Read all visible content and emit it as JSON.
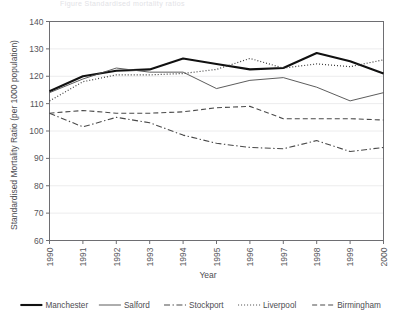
{
  "caption": {
    "text": "Figure   Standardised mortality ratios"
  },
  "chart_data": {
    "type": "line",
    "title": "",
    "xlabel": "Year",
    "ylabel": "Standardised Mortality Ratio (per 1000 population)",
    "categories": [
      "1990",
      "1991",
      "1992",
      "1993",
      "1994",
      "1995",
      "1996",
      "1997",
      "1998",
      "1999",
      "2000"
    ],
    "x": [
      1990,
      1991,
      1992,
      1993,
      1994,
      1995,
      1996,
      1997,
      1998,
      1999,
      2000
    ],
    "ylim": [
      60,
      140
    ],
    "yticks": [
      60,
      70,
      80,
      90,
      100,
      110,
      120,
      130,
      140
    ],
    "xlim": [
      1990,
      2000
    ],
    "grid": true,
    "legend_position": "bottom",
    "series": [
      {
        "name": "Manchester",
        "style": "solid-thick",
        "color": "#111111",
        "values": [
          114.5,
          120.0,
          122.0,
          122.5,
          126.5,
          124.5,
          122.5,
          123.0,
          128.5,
          125.5,
          121.0
        ]
      },
      {
        "name": "Salford",
        "style": "solid-thin",
        "color": "#4a4a4a",
        "values": [
          114.0,
          119.0,
          123.0,
          121.5,
          121.5,
          115.5,
          118.5,
          119.5,
          116.0,
          111.0,
          114.0
        ]
      },
      {
        "name": "Stockport",
        "style": "dash-dot",
        "color": "#4a4a4a",
        "values": [
          106.5,
          101.5,
          105.0,
          103.0,
          98.5,
          95.5,
          94.0,
          93.5,
          96.5,
          92.5,
          94.0
        ]
      },
      {
        "name": "Liverpool",
        "style": "dotted",
        "color": "#3c3c3c",
        "values": [
          111.0,
          118.0,
          120.5,
          120.5,
          121.0,
          122.5,
          126.5,
          123.0,
          124.5,
          123.5,
          126.0
        ]
      },
      {
        "name": "Birmingham",
        "style": "dashed",
        "color": "#4a4a4a",
        "values": [
          106.5,
          107.5,
          106.5,
          106.5,
          107.0,
          108.5,
          109.0,
          104.5,
          104.5,
          104.5,
          104.0
        ]
      }
    ]
  },
  "legend": {
    "items": [
      {
        "label": "Manchester",
        "style": "solid-thick"
      },
      {
        "label": "Salford",
        "style": "solid-thin"
      },
      {
        "label": "Stockport",
        "style": "dash-dot"
      },
      {
        "label": "Liverpool",
        "style": "dotted"
      },
      {
        "label": "Birmingham",
        "style": "dashed"
      }
    ]
  }
}
